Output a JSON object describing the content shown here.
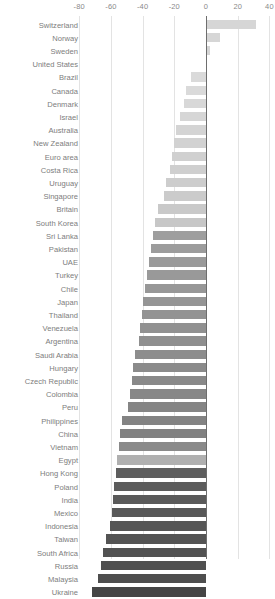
{
  "chart": {
    "type": "bar",
    "orientation": "horizontal",
    "title": "",
    "subtitle": "",
    "xlabel": "",
    "ylabel": "",
    "grid": true,
    "legend": false,
    "axis_position": "top"
  },
  "axis": {
    "ticks": [
      {
        "label": "-80",
        "value": -80
      },
      {
        "label": "-60",
        "value": -60
      },
      {
        "label": "-40",
        "value": -40
      },
      {
        "label": "-20",
        "value": -20
      },
      {
        "label": "0",
        "value": 0
      },
      {
        "label": "20",
        "value": 20
      },
      {
        "label": "40",
        "value": 40
      }
    ],
    "xlim": [
      -88,
      44
    ]
  },
  "chart_data": {
    "type": "bar",
    "orientation": "horizontal",
    "title": "",
    "xlabel": "",
    "ylabel": "",
    "xlim": [
      -88,
      44
    ],
    "grid": true,
    "legend": false,
    "categories": [
      "Switzerland",
      "Norway",
      "Sweden",
      "United States",
      "Brazil",
      "Canada",
      "Denmark",
      "Israel",
      "Australia",
      "New Zealand",
      "Euro area",
      "Costa Rica",
      "Uruguay",
      "Singapore",
      "Britain",
      "South Korea",
      "Sri Lanka",
      "Pakistan",
      "UAE",
      "Turkey",
      "Chile",
      "Japan",
      "Thailand",
      "Venezuela",
      "Argentina",
      "Saudi Arabia",
      "Hungary",
      "Czech Republic",
      "Colombia",
      "Peru",
      "Philippines",
      "China",
      "Vietnam",
      "Egypt",
      "Hong Kong",
      "Poland",
      "India",
      "Mexico",
      "Indonesia",
      "Taiwan",
      "South Africa",
      "Russia",
      "Malaysia",
      "Ukraine"
    ],
    "values": [
      31.5,
      9.0,
      2.5,
      0.0,
      -9.5,
      -12.5,
      -14.0,
      -16.5,
      -19.0,
      -20.5,
      -21.5,
      -22.5,
      -25.0,
      -26.5,
      -30.0,
      -32.0,
      -33.5,
      -35.0,
      -36.0,
      -37.5,
      -38.5,
      -39.5,
      -40.5,
      -41.5,
      -42.5,
      -45.0,
      -46.0,
      -47.0,
      -48.0,
      -49.0,
      -53.0,
      -54.0,
      -55.0,
      -56.0,
      -57.0,
      -58.0,
      -58.5,
      -59.5,
      -60.5,
      -63.0,
      -65.0,
      -66.0,
      -68.0,
      -72.0
    ],
    "colors": [
      "#d6d6d6",
      "#d6d6d6",
      "#d6d6d6",
      "#d6d6d6",
      "#dadada",
      "#dadada",
      "#d8d8d8",
      "#d6d6d6",
      "#d4d4d4",
      "#d2d2d2",
      "#d0d0d0",
      "#cfcfcf",
      "#cdcdcd",
      "#cbcbcb",
      "#c9c9c9",
      "#c7c7c7",
      "#9e9e9e",
      "#9c9c9c",
      "#9a9a9a",
      "#999999",
      "#979797",
      "#959595",
      "#939393",
      "#919191",
      "#8f8f8f",
      "#8d8d8d",
      "#8b8b8b",
      "#898989",
      "#878787",
      "#858585",
      "#838383",
      "#818181",
      "#8a8a8a",
      "#b0b0b0",
      "#5e5e5e",
      "#5c5c5c",
      "#5a5a5a",
      "#585858",
      "#565656",
      "#545454",
      "#525252",
      "#505050",
      "#4e4e4e",
      "#454545"
    ]
  }
}
